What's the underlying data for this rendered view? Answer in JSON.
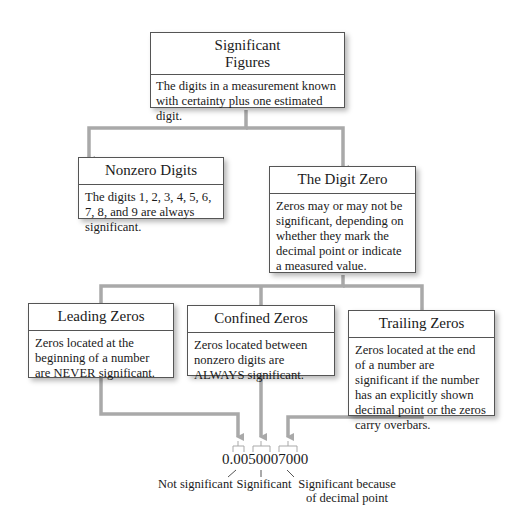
{
  "root": {
    "title_line1": "Significant",
    "title_line2": "Figures",
    "description": "The digits in a measurement known with certainty plus one estimated digit."
  },
  "level2": [
    {
      "title": "Nonzero Digits",
      "description": "The digits 1, 2, 3, 4, 5, 6, 7, 8, and 9 are always significant."
    },
    {
      "title": "The Digit Zero",
      "description": "Zeros may or may not be significant, depending on whether they mark the decimal point or indicate a measured value."
    }
  ],
  "level3": [
    {
      "title": "Leading Zeros",
      "description": "Zeros located at the beginning of a number are NEVER significant."
    },
    {
      "title": "Confined Zeros",
      "description": "Zeros located between nonzero digits are ALWAYS significant."
    },
    {
      "title": "Trailing Zeros",
      "description": "Zeros located at the end of a number are significant if the number has an explicitly shown decimal point or the zeros carry overbars."
    }
  ],
  "example": {
    "number": "0.0050007000",
    "labels": {
      "leading": "Not significant",
      "confined": "Significant",
      "trailing_line1": "Significant because",
      "trailing_line2": "of decimal point"
    }
  },
  "colors": {
    "connector": "#a9a9a9",
    "border": "#555555",
    "text": "#1a1a1a"
  }
}
